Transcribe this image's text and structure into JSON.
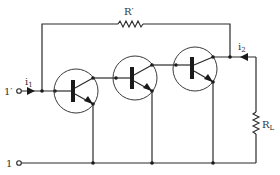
{
  "diagram": {
    "type": "circuit-schematic",
    "labels": {
      "feedback_resistor": "R",
      "feedback_resistor_prime": "′",
      "load_resistor": "R",
      "load_resistor_sub": "L",
      "input_current": "i",
      "input_current_sub": "1",
      "output_current": "i",
      "output_current_sub": "2",
      "terminal_top": "1′",
      "terminal_bottom": "1"
    },
    "components": [
      {
        "id": "T1",
        "kind": "npn-transistor"
      },
      {
        "id": "T2",
        "kind": "npn-transistor"
      },
      {
        "id": "T3",
        "kind": "npn-transistor"
      },
      {
        "id": "R'",
        "kind": "resistor",
        "role": "feedback"
      },
      {
        "id": "R_L",
        "kind": "resistor",
        "role": "load"
      }
    ],
    "colors": {
      "line": "#2a2a2a",
      "background": "#ffffff"
    }
  }
}
